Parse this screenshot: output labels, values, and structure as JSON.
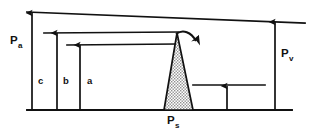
{
  "figure": {
    "background_color": "#ffffff",
    "stroke_color": "#111111",
    "fill_pattern_color": "#9a9a9a",
    "labels": {
      "arterial": {
        "base": "P",
        "sub": "a",
        "x": 14,
        "y": 44
      },
      "venous": {
        "base": "P",
        "sub": "v",
        "x": 280,
        "y": 58
      },
      "stenosis": {
        "base": "P",
        "sub": "s",
        "x": 172,
        "y": 124
      },
      "segment_c": {
        "text": "c",
        "x": 35,
        "y": 84
      },
      "segment_b": {
        "text": "b",
        "x": 60,
        "y": 84
      },
      "segment_a": {
        "text": "a",
        "x": 84,
        "y": 84
      }
    },
    "levels": [
      {
        "name": "top-sloping-line",
        "x1": 27,
        "y1": 12,
        "x2": 305,
        "y2": 23
      },
      {
        "name": "second-level-line",
        "x1": 44,
        "y1": 33,
        "x2": 178,
        "y2": 32
      },
      {
        "name": "third-level-line",
        "x1": 67,
        "y1": 45,
        "x2": 176,
        "y2": 44
      },
      {
        "name": "distal-level-line",
        "x1": 193,
        "y1": 85,
        "x2": 265,
        "y2": 85
      },
      {
        "name": "baseline",
        "x1": 27,
        "y1": 110,
        "x2": 292,
        "y2": 110
      }
    ],
    "arrows": [
      {
        "name": "arrow-c",
        "x": 32,
        "top": 13,
        "bottom": 110
      },
      {
        "name": "arrow-b",
        "x": 57,
        "top": 33,
        "bottom": 110
      },
      {
        "name": "arrow-a",
        "x": 80,
        "top": 45,
        "bottom": 110
      },
      {
        "name": "arrow-distal",
        "x": 227,
        "top": 86,
        "bottom": 110
      },
      {
        "name": "arrow-pv",
        "x": 275,
        "top": 22,
        "bottom": 110
      }
    ],
    "peak": {
      "name": "stenosis-peak",
      "apex_x": 177,
      "apex_y": 33,
      "left_base_x": 164,
      "right_base_x": 193,
      "base_y": 110
    },
    "curved_arrow": {
      "name": "flow-direction-arrow",
      "start_x": 177,
      "start_y": 33,
      "end_x": 199,
      "end_y": 45
    }
  }
}
